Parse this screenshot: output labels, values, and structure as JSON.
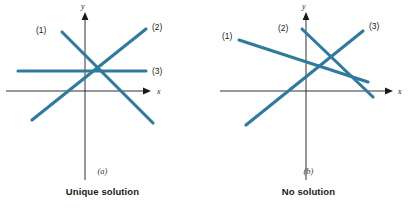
{
  "figure": {
    "panels": [
      {
        "id": "a",
        "letter": "(a)",
        "caption": "Unique solution",
        "axis": {
          "x_label": "x",
          "y_label": "y"
        },
        "line_labels": [
          {
            "name": "(1)",
            "x": 36,
            "y": 33
          },
          {
            "name": "(2)",
            "x": 152,
            "y": 30
          },
          {
            "name": "(3)",
            "x": 152,
            "y": 71
          }
        ],
        "lines": [
          {
            "label": "(1)",
            "x1": 62,
            "y1": 32,
            "x2": 153,
            "y2": 123
          },
          {
            "label": "(2)",
            "x1": 32,
            "y1": 120,
            "x2": 146,
            "y2": 29
          },
          {
            "label": "(3)",
            "x1": 18,
            "y1": 71,
            "x2": 146,
            "y2": 71
          }
        ],
        "intersection": {
          "x": 102,
          "y": 71
        }
      },
      {
        "id": "b",
        "letter": "(b)",
        "caption": "No solution",
        "axis": {
          "x_label": "x",
          "y_label": "y"
        },
        "line_labels": [
          {
            "name": "(1)",
            "x": 21,
            "y": 37
          },
          {
            "name": "(2)",
            "x": 79,
            "y": 29
          },
          {
            "name": "(3)",
            "x": 167,
            "y": 32
          }
        ],
        "lines": [
          {
            "label": "(1)",
            "x1": 33,
            "y1": 40,
            "x2": 162,
            "y2": 82
          },
          {
            "label": "(2)",
            "x1": 96,
            "y1": 29,
            "x2": 167,
            "y2": 97
          },
          {
            "label": "(3)",
            "x1": 40,
            "y1": 125,
            "x2": 157,
            "y2": 31
          }
        ]
      }
    ],
    "colors": {
      "line": "#2e7b9e",
      "axis": "#1a1a1a",
      "caption_text": "#1a1a1a",
      "background": "#ffffff"
    },
    "axis_geometry": {
      "a": {
        "origin_x": 85,
        "origin_y": 91,
        "x_axis_start": 6,
        "x_axis_end": 148,
        "y_axis_top": 12,
        "y_axis_bottom": 180
      },
      "b": {
        "origin_x": 100,
        "origin_y": 91,
        "x_axis_start": 14,
        "x_axis_end": 184,
        "y_axis_top": 12,
        "y_axis_bottom": 180
      }
    }
  }
}
